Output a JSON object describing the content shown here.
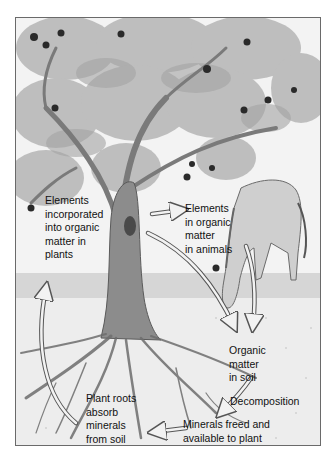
{
  "diagram": {
    "labels": {
      "plants": "Elements\nincorporated\ninto organic\nmatter in\nplants",
      "animals": "Elements\nin organic\nmatter\nin animals",
      "soil": "Organic\nmatter\nin soil",
      "decomposition": "Decomposition",
      "minerals": "Minerals freed and\navailable to plant",
      "roots": "Plant roots\nabsorb\nminerals\nfrom soil"
    },
    "flows": [
      {
        "from": "plants",
        "to": "animals"
      },
      {
        "from": "plants",
        "to": "soil"
      },
      {
        "from": "animals",
        "to": "soil"
      },
      {
        "from": "soil",
        "to": "minerals",
        "label": "Decomposition"
      },
      {
        "from": "minerals",
        "to": "roots"
      },
      {
        "from": "roots",
        "to": "plants"
      }
    ],
    "colors": {
      "sky": "#f4f4f4",
      "foliage": "#b8b8b8",
      "trunk": "#8a8a8a",
      "fruit": "#2a2a2a",
      "soil": "#ececec",
      "arrow_fill": "#f2f2f2",
      "arrow_stroke": "#555555"
    }
  }
}
